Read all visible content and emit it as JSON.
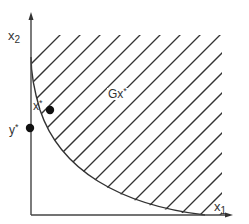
{
  "figure": {
    "type": "set-diagram",
    "colors": {
      "ink": "#333333",
      "background": "#ffffff"
    }
  },
  "axes": {
    "x_label": {
      "base": "x",
      "sub": "1"
    },
    "y_label": {
      "base": "x",
      "sub": "2"
    }
  },
  "region": {
    "label": {
      "base": "Gx",
      "sup": "*"
    },
    "hatch": "diagonal"
  },
  "points": [
    {
      "id": "x-star",
      "label": {
        "base": "x",
        "sup": "*"
      },
      "position": "on boundary curve"
    },
    {
      "id": "y-star",
      "label": {
        "base": "y",
        "sup": "*"
      },
      "position": "on x2 axis"
    }
  ]
}
